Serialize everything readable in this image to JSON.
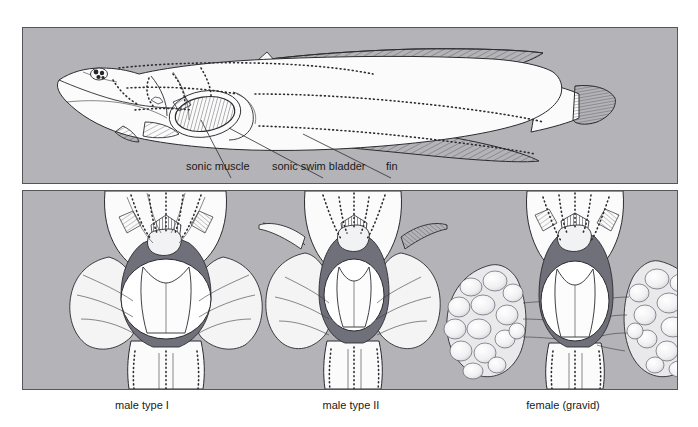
{
  "figure": {
    "background_color": "#ffffff",
    "panel_color": "#b4b4b8",
    "ink_color": "#2b2b30",
    "muscle_color": "#70707a"
  },
  "panel_top": {
    "name": "lateral-view-panel",
    "subject": "whole fish lateral view",
    "labels": [
      {
        "text": "sonic muscle",
        "x": 186,
        "y": 166
      },
      {
        "text": "sonic swim bladder",
        "x": 272,
        "y": 166
      },
      {
        "text": "fin",
        "x": 386,
        "y": 166
      }
    ],
    "parts": {
      "eye": "eye",
      "pectoral_fin": "pectoral-fin",
      "dorsal_fin": "dorsal-fin",
      "anal_fin": "anal-fin",
      "caudal_fin": "caudal-fin",
      "swim_bladder": "sonic-swim-bladder",
      "sonic_muscle": "sonic-muscle"
    }
  },
  "panel_bottom": {
    "name": "ventral-dissection-panel",
    "specimens": [
      {
        "id": "male-type-I",
        "caption": "male type I",
        "caption_x": 142,
        "caption_y": 400,
        "features": "large paired sonic muscles, large swim bladder, no ovaries"
      },
      {
        "id": "male-type-II",
        "caption": "male type II",
        "caption_x": 351,
        "caption_y": 400,
        "features": "small narrow sonic muscles, small swim bladder"
      },
      {
        "id": "female-gravid",
        "caption": "female (gravid)",
        "caption_x": 563,
        "caption_y": 400,
        "features": "large paired ovaries filled with eggs, small sonic muscle"
      }
    ]
  }
}
